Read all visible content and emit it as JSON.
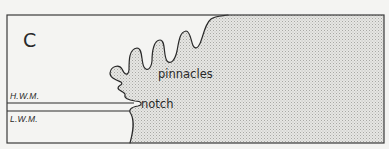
{
  "figure": {
    "panel_label": "C",
    "labels": {
      "high_water_mark": "H.W.M.",
      "low_water_mark": "L.W.M.",
      "pinnacles": "pinnacles",
      "notch": "notch"
    },
    "colors": {
      "background": "#f4f4f2",
      "line": "#2a2a2a",
      "rock_fill": "#d9d9d6"
    }
  }
}
